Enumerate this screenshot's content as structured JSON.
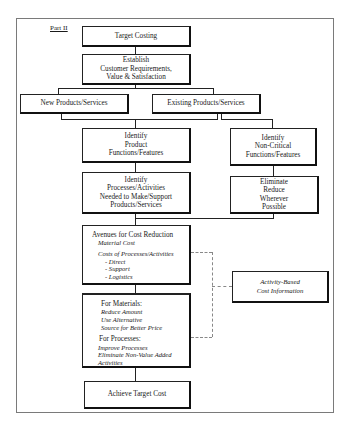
{
  "part_label": "Part II",
  "nodes": {
    "target_costing": "Target Costing",
    "establish": [
      "Establish",
      "Customer Requirements,",
      "Value & Satisfaction"
    ],
    "new_products": "New Products/Services",
    "existing_products": "Existing Products/Services",
    "identify_functions": [
      "Identify",
      "Product",
      "Functions/Features"
    ],
    "identify_noncritical": [
      "Identify",
      "Non-Critical",
      "Functions/Features"
    ],
    "identify_processes": [
      "Identify",
      "Processes/Activities",
      "Needed to Make/Support",
      "Products/Services"
    ],
    "eliminate": [
      "Eliminate",
      "Reduce",
      "Wherever",
      "Possible"
    ],
    "avenues": {
      "title": "Avenues for Cost Reduction",
      "material_cost": "Material Cost",
      "costs_of_processes": "Costs of Processes/Activities",
      "items": [
        "- Direct",
        "- Support",
        "- Logistics"
      ]
    },
    "actions": {
      "materials_title": "For Materials:",
      "materials_items": [
        "Reduce Amount",
        "Use Alternative",
        "Source for Better Price"
      ],
      "processes_title": "For Processes:",
      "processes_items": [
        "Improve Processes",
        "Eliminate Non-Value Added",
        "Activities"
      ]
    },
    "abc": [
      "Activity-Based",
      "Cost Information"
    ],
    "achieve": "Achieve Target Cost"
  }
}
